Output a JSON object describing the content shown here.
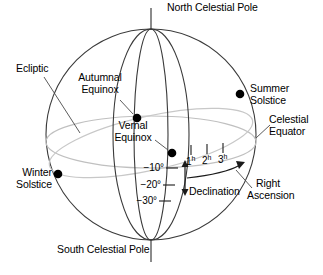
{
  "diagram": {
    "type": "astronomy-celestial-sphere",
    "colors": {
      "background": "#ffffff",
      "outline": "#3a3a3a",
      "meridian": "#3a3a3a",
      "equator": "#b9b9b9",
      "ecliptic": "#c3c3c3",
      "marker": "#000000",
      "text": "#000000"
    }
  },
  "labels": {
    "north_celestial_pole": "North Celestial Pole",
    "south_celestial_pole": "South Celestial Pole",
    "ecliptic": "Ecliptic",
    "autumnal_equinox_line1": "Autumnal",
    "autumnal_equinox_line2": "Equinox",
    "vernal_equinox_line1": "Vernal",
    "vernal_equinox_line2": "Equinox",
    "summer_solstice_line1": "Summer",
    "summer_solstice_line2": "Solstice",
    "winter_solstice_line1": "Winter",
    "winter_solstice_line2": "Solstice",
    "celestial_equator_line1": "Celestial",
    "celestial_equator_line2": "Equator",
    "right_ascension_line1": "Right",
    "right_ascension_line2": "Ascension",
    "declination": "Declination"
  },
  "declination_ticks": [
    {
      "value": "−10",
      "unit": "°",
      "label": "−10°"
    },
    {
      "value": "−20",
      "unit": "°",
      "label": "−20°"
    },
    {
      "value": "−30",
      "unit": "°",
      "label": "−30°"
    }
  ],
  "right_ascension_ticks": [
    {
      "value": "1",
      "unit": "h",
      "label": "1h"
    },
    {
      "value": "2",
      "unit": "h",
      "label": "2h"
    },
    {
      "value": "3",
      "unit": "h",
      "label": "3h"
    }
  ],
  "points": [
    {
      "name": "autumnal-equinox",
      "label": "Autumnal Equinox"
    },
    {
      "name": "vernal-equinox",
      "label": "Vernal Equinox"
    },
    {
      "name": "summer-solstice",
      "label": "Summer Solstice"
    },
    {
      "name": "winter-solstice",
      "label": "Winter Solstice"
    }
  ]
}
